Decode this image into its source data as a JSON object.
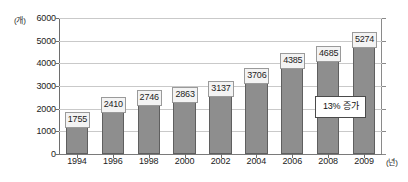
{
  "chart_data": {
    "type": "bar",
    "title": "",
    "xlabel": "(년)",
    "ylabel": "(개)",
    "categories": [
      "1994",
      "1996",
      "1998",
      "2000",
      "2002",
      "2004",
      "2006",
      "2008",
      "2009"
    ],
    "values": [
      1755,
      2410,
      2746,
      2863,
      3137,
      3706,
      4385,
      4685,
      5274
    ],
    "ylim": [
      0,
      6000
    ],
    "y_ticks": [
      "0",
      "1000",
      "2000",
      "3000",
      "4000",
      "5000",
      "6000"
    ],
    "y_tick_values": [
      0,
      1000,
      2000,
      3000,
      4000,
      5000,
      6000
    ],
    "grid": true,
    "legend": "none",
    "annotations": [
      {
        "text": "13% 증가",
        "near_category": "2009"
      }
    ],
    "bar_color": "#8e8e8e",
    "bar_border_color": "#5f5f5f",
    "grid_color": "#c9c9c9",
    "axis_color": "#6e6e6e",
    "label_box_bg": "#f3f3f3"
  },
  "axes": {
    "y_unit": "(개)",
    "x_unit": "(년)"
  }
}
